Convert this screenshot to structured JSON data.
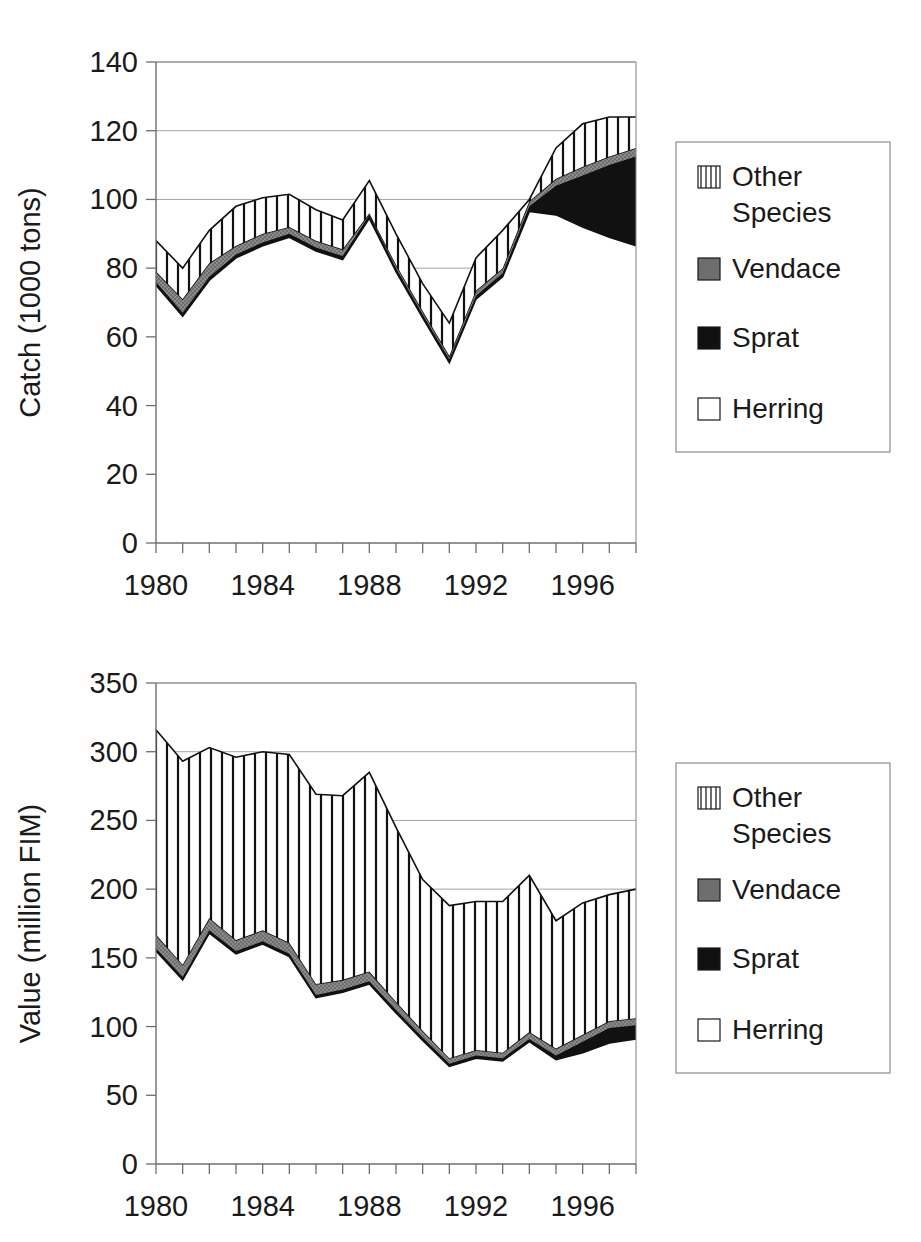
{
  "figures": [
    {
      "id": "catch",
      "axis_title": "Catch (1000 tons)",
      "legend": {
        "items": [
          {
            "label": "Other Species",
            "label_line1": "Other",
            "label_line2": "Species",
            "swatch": "vertical-stripes-swatch",
            "color": "#ffffff"
          },
          {
            "label": "Vendace",
            "label_line1": "Vendace",
            "label_line2": "",
            "swatch": "gray-fill-swatch",
            "color": "#7f7f7f"
          },
          {
            "label": "Sprat",
            "label_line1": "Sprat",
            "label_line2": "",
            "swatch": "black-fill-swatch",
            "color": "#111111"
          },
          {
            "label": "Herring",
            "label_line1": "Herring",
            "label_line2": "",
            "swatch": "white-fill-swatch",
            "color": "#ffffff"
          }
        ]
      }
    },
    {
      "id": "value",
      "axis_title": "Value (million FIM)",
      "legend": {
        "items": [
          {
            "label": "Other Species",
            "label_line1": "Other",
            "label_line2": "Species",
            "swatch": "vertical-stripes-swatch",
            "color": "#ffffff"
          },
          {
            "label": "Vendace",
            "label_line1": "Vendace",
            "label_line2": "",
            "swatch": "gray-fill-swatch",
            "color": "#7f7f7f"
          },
          {
            "label": "Sprat",
            "label_line1": "Sprat",
            "label_line2": "",
            "swatch": "black-fill-swatch",
            "color": "#111111"
          },
          {
            "label": "Herring",
            "label_line1": "Herring",
            "label_line2": "",
            "swatch": "white-fill-swatch",
            "color": "#ffffff"
          }
        ]
      }
    }
  ],
  "chart_data": [
    {
      "type": "area",
      "id": "catch",
      "title": "",
      "xlabel": "",
      "ylabel": "Catch (1000 tons)",
      "xlim": [
        1980,
        1998
      ],
      "ylim": [
        0,
        140
      ],
      "ytick_step": 20,
      "yticks": [
        0,
        20,
        40,
        60,
        80,
        100,
        120,
        140
      ],
      "xticks": [
        1980,
        1984,
        1988,
        1992,
        1996
      ],
      "xtick_all": [
        1980,
        1981,
        1982,
        1983,
        1984,
        1985,
        1986,
        1987,
        1988,
        1989,
        1990,
        1991,
        1992,
        1993,
        1994,
        1995,
        1996,
        1997,
        1998
      ],
      "grid": "horizontal",
      "stacked": true,
      "stack_order": [
        "Herring",
        "Sprat",
        "Vendace",
        "Other Species"
      ],
      "legend_position": "right",
      "x": [
        1980,
        1981,
        1982,
        1983,
        1984,
        1985,
        1986,
        1987,
        1988,
        1989,
        1990,
        1991,
        1992,
        1993,
        1994,
        1995,
        1996,
        1997,
        1998
      ],
      "series": [
        {
          "name": "Herring",
          "fill": "white",
          "values": [
            75.0,
            66.0,
            76.5,
            83.0,
            86.5,
            89.0,
            85.0,
            82.5,
            94.5,
            79.0,
            65.5,
            52.5,
            71.0,
            77.5,
            96.5,
            95.5,
            92.0,
            89.0,
            86.5
          ]
        },
        {
          "name": "Sprat",
          "fill": "black",
          "values": [
            1.0,
            1.0,
            1.0,
            1.0,
            1.0,
            1.0,
            1.0,
            1.0,
            1.0,
            1.0,
            1.0,
            1.0,
            1.0,
            1.0,
            1.5,
            8.5,
            15.0,
            21.0,
            26.0
          ]
        },
        {
          "name": "Vendace",
          "fill": "gray",
          "values": [
            3.0,
            4.0,
            4.0,
            2.5,
            2.5,
            2.0,
            2.0,
            2.0,
            0.5,
            1.0,
            1.0,
            1.0,
            1.5,
            1.5,
            1.5,
            2.0,
            2.5,
            2.5,
            2.5
          ]
        },
        {
          "name": "Other Species",
          "fill": "stripes",
          "values": [
            9.0,
            9.0,
            9.5,
            11.5,
            10.5,
            9.5,
            9.0,
            8.5,
            9.5,
            9.0,
            8.0,
            9.5,
            9.5,
            11.0,
            0.5,
            9.0,
            12.5,
            11.5,
            9.0
          ]
        }
      ],
      "totals": [
        88.0,
        80.0,
        91.0,
        98.0,
        100.5,
        101.5,
        97.0,
        94.0,
        105.5,
        90.0,
        75.5,
        64.0,
        83.0,
        91.0,
        100.0,
        115.0,
        122.0,
        124.0,
        124.0
      ]
    },
    {
      "type": "area",
      "id": "value",
      "title": "",
      "xlabel": "",
      "ylabel": "Value (million FIM)",
      "xlim": [
        1980,
        1998
      ],
      "ylim": [
        0,
        350
      ],
      "ytick_step": 50,
      "yticks": [
        0,
        50,
        100,
        150,
        200,
        250,
        300,
        350
      ],
      "xticks": [
        1980,
        1984,
        1988,
        1992,
        1996
      ],
      "xtick_all": [
        1980,
        1981,
        1982,
        1983,
        1984,
        1985,
        1986,
        1987,
        1988,
        1989,
        1990,
        1991,
        1992,
        1993,
        1994,
        1995,
        1996,
        1997,
        1998
      ],
      "grid": "horizontal",
      "stacked": true,
      "stack_order": [
        "Herring",
        "Sprat",
        "Vendace",
        "Other Species"
      ],
      "legend_position": "right",
      "x": [
        1980,
        1981,
        1982,
        1983,
        1984,
        1985,
        1986,
        1987,
        1988,
        1989,
        1990,
        1991,
        1992,
        1993,
        1994,
        1995,
        1996,
        1997,
        1998
      ],
      "series": [
        {
          "name": "Herring",
          "fill": "white",
          "values": [
            155.0,
            134.0,
            168.0,
            153.0,
            160.0,
            151.0,
            121.0,
            125.0,
            131.0,
            110.0,
            90.0,
            71.0,
            77.0,
            75.0,
            89.0,
            76.0,
            81.0,
            88.0,
            91.0
          ]
        },
        {
          "name": "Sprat",
          "fill": "black",
          "values": [
            2.0,
            2.0,
            2.0,
            2.0,
            2.0,
            2.0,
            2.0,
            2.0,
            2.0,
            2.0,
            2.0,
            2.0,
            2.0,
            2.0,
            2.0,
            3.0,
            8.0,
            11.0,
            10.0
          ]
        },
        {
          "name": "Vendace",
          "fill": "gray",
          "values": [
            10.0,
            9.0,
            9.0,
            8.0,
            8.0,
            8.0,
            8.0,
            7.0,
            7.0,
            6.0,
            5.0,
            4.0,
            4.0,
            4.0,
            5.0,
            5.0,
            5.0,
            5.0,
            5.0
          ]
        },
        {
          "name": "Other Species",
          "fill": "stripes",
          "values": [
            149.0,
            148.0,
            124.0,
            133.0,
            130.0,
            137.0,
            138.0,
            134.0,
            145.0,
            127.0,
            110.0,
            111.0,
            108.0,
            110.0,
            114.0,
            93.0,
            96.0,
            92.0,
            94.0
          ]
        }
      ],
      "totals": [
        316.0,
        293.0,
        303.0,
        296.0,
        300.0,
        298.0,
        269.0,
        268.0,
        285.0,
        245.0,
        207.0,
        188.0,
        191.0,
        191.0,
        210.0,
        177.0,
        190.0,
        196.0,
        200.0
      ]
    }
  ]
}
